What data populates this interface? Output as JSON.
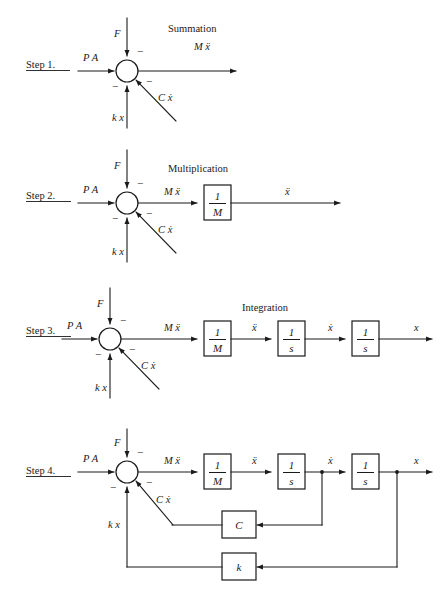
{
  "document": {
    "title": "Block Diagram Construction of a Mass-Spring-Damper System",
    "type": "control-system-block-diagram",
    "ink_color": "#1a1a1a",
    "background_color": "#ffffff"
  },
  "symbols": {
    "force_input": "F",
    "pressure_input": "P A",
    "spring_feedback": "k x",
    "damper_feedback": "C ẋ",
    "mass_accel": "M ẍ",
    "acceleration": "ẍ",
    "velocity": "ẋ",
    "position": "x",
    "minus": "−",
    "numerator_one": "1",
    "denom_mass": "M",
    "denom_s": "s",
    "gain_damping": "C",
    "gain_spring": "k"
  },
  "steps": [
    {
      "id": "step-1",
      "label": "Step 1.",
      "section_title": "Summation",
      "inputs": [
        {
          "name": "force",
          "text": "F",
          "direction": "down-into-junction",
          "sign": "minus"
        },
        {
          "name": "pressure-area",
          "text": "P A",
          "direction": "right-into-junction",
          "sign": "plus"
        },
        {
          "name": "spring-force",
          "text": "k x",
          "direction": "up-into-junction",
          "sign": "minus"
        },
        {
          "name": "damping-force",
          "text": "C ẋ",
          "direction": "diagonal-into-junction",
          "sign": "minus"
        }
      ],
      "outputs": [
        {
          "name": "mass-times-acceleration",
          "text": "M ẍ"
        }
      ],
      "blocks": []
    },
    {
      "id": "step-2",
      "label": "Step 2.",
      "section_title": "Multiplication",
      "inputs": [
        {
          "name": "force",
          "text": "F",
          "direction": "down-into-junction",
          "sign": "minus"
        },
        {
          "name": "pressure-area",
          "text": "P A",
          "direction": "right-into-junction",
          "sign": "plus"
        },
        {
          "name": "spring-force",
          "text": "k x",
          "direction": "up-into-junction",
          "sign": "minus"
        },
        {
          "name": "damping-force",
          "text": "C ẋ",
          "direction": "diagonal-into-junction",
          "sign": "minus"
        }
      ],
      "outputs": [
        {
          "name": "mass-times-acceleration",
          "text": "M ẍ"
        },
        {
          "name": "acceleration",
          "text": "ẍ"
        }
      ],
      "blocks": [
        {
          "name": "inverse-mass-block",
          "numerator": "1",
          "denominator": "M"
        }
      ]
    },
    {
      "id": "step-3",
      "label": "Step 3.",
      "section_title": "Integration",
      "inputs": [
        {
          "name": "force",
          "text": "F",
          "direction": "down-into-junction",
          "sign": "minus"
        },
        {
          "name": "pressure-area",
          "text": "P A",
          "direction": "right-into-junction",
          "sign": "plus"
        },
        {
          "name": "spring-force",
          "text": "k x",
          "direction": "up-into-junction",
          "sign": "minus"
        },
        {
          "name": "damping-force",
          "text": "C ẋ",
          "direction": "diagonal-into-junction",
          "sign": "minus"
        }
      ],
      "outputs": [
        {
          "name": "mass-times-acceleration",
          "text": "M ẍ"
        },
        {
          "name": "acceleration",
          "text": "ẍ"
        },
        {
          "name": "velocity",
          "text": "ẋ"
        },
        {
          "name": "position",
          "text": "x"
        }
      ],
      "blocks": [
        {
          "name": "inverse-mass-block",
          "numerator": "1",
          "denominator": "M"
        },
        {
          "name": "first-integrator-block",
          "numerator": "1",
          "denominator": "s"
        },
        {
          "name": "second-integrator-block",
          "numerator": "1",
          "denominator": "s"
        }
      ]
    },
    {
      "id": "step-4",
      "label": "Step 4.",
      "section_title": "",
      "inputs": [
        {
          "name": "force",
          "text": "F",
          "direction": "down-into-junction",
          "sign": "minus"
        },
        {
          "name": "pressure-area",
          "text": "P A",
          "direction": "right-into-junction",
          "sign": "plus"
        },
        {
          "name": "spring-force",
          "text": "k x",
          "direction": "up-into-junction",
          "sign": "minus"
        },
        {
          "name": "damping-force",
          "text": "C ẋ",
          "direction": "diagonal-into-junction",
          "sign": "minus"
        }
      ],
      "outputs": [
        {
          "name": "mass-times-acceleration",
          "text": "M ẍ"
        },
        {
          "name": "acceleration",
          "text": "ẍ"
        },
        {
          "name": "velocity",
          "text": "ẋ"
        },
        {
          "name": "position",
          "text": "x"
        }
      ],
      "blocks": [
        {
          "name": "inverse-mass-block",
          "numerator": "1",
          "denominator": "M"
        },
        {
          "name": "first-integrator-block",
          "numerator": "1",
          "denominator": "s"
        },
        {
          "name": "second-integrator-block",
          "numerator": "1",
          "denominator": "s"
        },
        {
          "name": "damping-gain-block",
          "label": "C"
        },
        {
          "name": "spring-gain-block",
          "label": "k"
        }
      ],
      "feedback_paths": [
        {
          "name": "velocity-feedback",
          "from": "velocity",
          "through": "C",
          "to": "summing-junction"
        },
        {
          "name": "position-feedback",
          "from": "position",
          "through": "k",
          "to": "summing-junction"
        }
      ]
    }
  ]
}
